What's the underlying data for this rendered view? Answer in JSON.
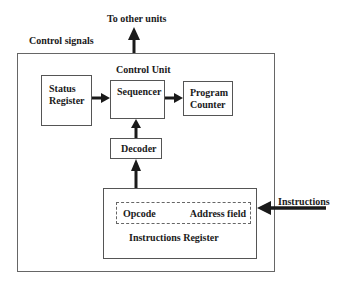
{
  "diagram": {
    "title": "Control Unit",
    "external_labels": {
      "to_other_units": "To other units",
      "control_signals": "Control signals",
      "instructions": "Instructions"
    },
    "blocks": {
      "status_register": {
        "line1": "Status",
        "line2": "Register"
      },
      "sequencer": {
        "label": "Sequencer"
      },
      "program_counter": {
        "line1": "Program",
        "line2": "Counter"
      },
      "decoder": {
        "label": "Decoder"
      },
      "instructions_register": {
        "label": "Instructions Register",
        "fields": {
          "opcode": "Opcode",
          "address": "Address field"
        }
      }
    },
    "edges": [
      {
        "from": "Status Register",
        "to": "Sequencer"
      },
      {
        "from": "Sequencer",
        "to": "Program Counter"
      },
      {
        "from": "Decoder",
        "to": "Sequencer"
      },
      {
        "from": "Instructions Register",
        "to": "Decoder"
      },
      {
        "from": "Instructions",
        "to": "Instructions Register"
      },
      {
        "from": "Control Unit",
        "to": "To other units"
      }
    ]
  }
}
